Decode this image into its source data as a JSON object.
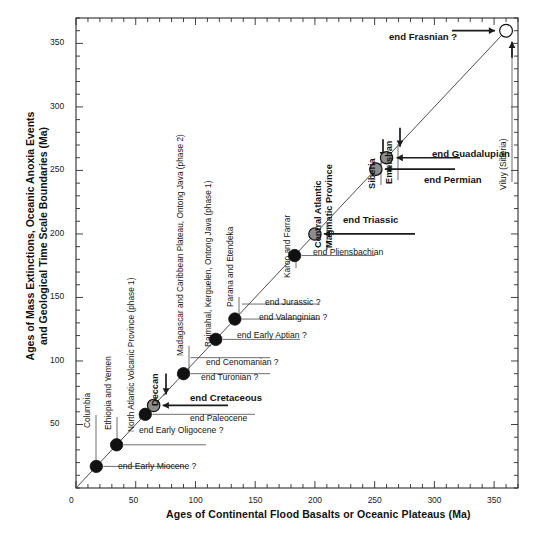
{
  "chart_data": {
    "type": "scatter",
    "title": "",
    "xlabel": "Ages of Continental Flood Basalts or Oceanic Plateaus (Ma)",
    "ylabel": "Ages of Mass Extinctions, Oceanic Anoxia Events and Geological Time Scale Boundaries (Ma)",
    "xlim": [
      0,
      370
    ],
    "ylim": [
      0,
      370
    ],
    "xticks": [
      0,
      50,
      100,
      150,
      200,
      250,
      300,
      350
    ],
    "xticklabels": [
      "0",
      "50",
      "100",
      "150",
      "200",
      "250",
      "300",
      "350"
    ],
    "yticks": [
      50,
      100,
      150,
      200,
      250,
      300,
      350
    ],
    "yticklabels": [
      "50",
      "100",
      "150",
      "200",
      "250",
      "300",
      "350"
    ],
    "minor_tick_interval": 10,
    "grid": false,
    "legend": "none",
    "reference_line": {
      "description": "1:1 line from origin through Viluy (Siberia) point",
      "x": [
        0,
        360
      ],
      "y": [
        0,
        360
      ]
    },
    "marker_styles": {
      "black": "#111111",
      "gray": "#8d8d8d",
      "open": "#ffffff",
      "edge": "#111111"
    },
    "points": [
      {
        "x": 17,
        "y": 17,
        "style": "black",
        "basalt": "Columbia",
        "event": "end Early Miocene ?"
      },
      {
        "x": 34,
        "y": 34,
        "style": "black",
        "basalt": "Ethiopia and Yemen",
        "event": "end Early Oligocene ?"
      },
      {
        "x": 58,
        "y": 58,
        "style": "black",
        "basalt": "North Atlantic Volcanic Province (phase 1)",
        "event": "end Paleocene"
      },
      {
        "x": 65,
        "y": 65,
        "style": "gray",
        "basalt": "Deccan",
        "event": "end Cretaceous"
      },
      {
        "x": 90,
        "y": 90,
        "style": "black",
        "basalt": "Madagascar and Caribbean Plateau, Ontong Java (phase 2)",
        "event": "end Cenomanian ? / end Turonian ?"
      },
      {
        "x": 117,
        "y": 117,
        "style": "black",
        "basalt": "Rajmahal, Kerguelen, Ontong Java (phase 1)",
        "event": "end Early Aptian ?"
      },
      {
        "x": 133,
        "y": 133,
        "style": "black",
        "basalt": "Parana and Etendeka",
        "event": "end Jurassic ? / end Valanginian ?"
      },
      {
        "x": 183,
        "y": 183,
        "style": "black",
        "basalt": "Karoo and Farrar",
        "event": "end Pliensbachian"
      },
      {
        "x": 200,
        "y": 200,
        "style": "gray",
        "basalt": "Central Atlantic Magmatic Province",
        "event": "end Triassic"
      },
      {
        "x": 251,
        "y": 251,
        "style": "gray",
        "basalt": "Siberia",
        "event": "end Permian"
      },
      {
        "x": 260,
        "y": 260,
        "style": "gray",
        "basalt": "Emeishan",
        "event": "end Guadalupian"
      },
      {
        "x": 360,
        "y": 360,
        "style": "open",
        "basalt": "Viluy (Siberia)",
        "event": "end Frasnian ?"
      }
    ]
  },
  "axes": {
    "x_title": "Ages of Continental Flood Basalts or Oceanic Plateaus (Ma)",
    "y_title_line1": "Ages of Mass Extinctions, Oceanic Anoxia Events",
    "y_title_line2": "and Geological Time Scale Boundaries (Ma)",
    "x_tick_labels": [
      "0",
      "50",
      "100",
      "150",
      "200",
      "250",
      "300",
      "350"
    ],
    "y_tick_labels": [
      "50",
      "100",
      "150",
      "200",
      "250",
      "300",
      "350"
    ]
  },
  "source_labels": {
    "columbia": "Columbia",
    "ethiopia": "Ethiopia and Yemen",
    "north_atlantic": "North Atlantic Volcanic Province (phase 1)",
    "deccan": "Deccan",
    "madagascar": "Madagascar and Caribbean Plateau, Ontong Java (phase 2)",
    "rajmahal": "Rajmahal, Kerguelen, Ontong Java (phase 1)",
    "parana": "Parana and Etendeka",
    "karoo": "Karoo and Farrar",
    "camp_line1": "Central Atlantic",
    "camp_line2": "Magmatic Province",
    "siberia": "Siberia",
    "emeishan": "Emeishan",
    "viluy": "Viluy (Siberia)"
  },
  "event_labels": {
    "early_miocene": "end Early Miocene ?",
    "early_oligocene": "end Early Oligocene ?",
    "paleocene": "end Paleocene",
    "cretaceous": "end Cretaceous",
    "turonian": "end Turonian ?",
    "cenomanian": "end Cenomanian ?",
    "early_aptian": "end Early Aptian ?",
    "valanginian": "end Valanginian ?",
    "jurassic": "end Jurassic ?",
    "pliensbachian": "end Pliensbachian",
    "triassic": "end Triassic",
    "permian": "end Permian",
    "guadalupian": "end Guadalupian",
    "frasnian": "end Frasnian ?"
  }
}
